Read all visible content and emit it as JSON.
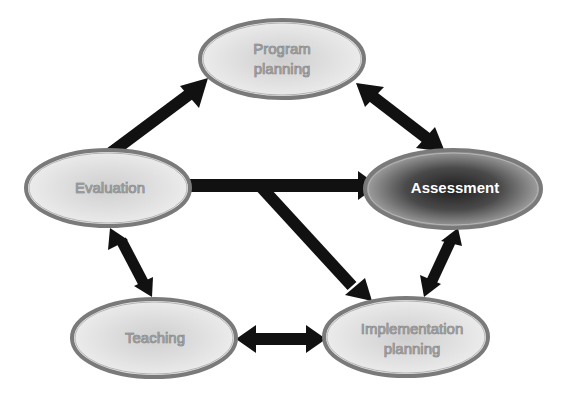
{
  "diagram": {
    "nodes": [
      {
        "id": "program-planning",
        "lines": [
          "Program",
          "planning"
        ],
        "style": "light"
      },
      {
        "id": "assessment",
        "lines": [
          "Assessment"
        ],
        "style": "dark"
      },
      {
        "id": "evaluation",
        "lines": [
          "Evaluation"
        ],
        "style": "light"
      },
      {
        "id": "teaching",
        "lines": [
          "Teaching"
        ],
        "style": "light"
      },
      {
        "id": "implementation-planning",
        "lines": [
          "Implementation",
          "planning"
        ],
        "style": "light"
      }
    ],
    "edges": [
      {
        "from": "evaluation",
        "to": "program-planning",
        "direction": "one-way"
      },
      {
        "from": "program-planning",
        "to": "assessment",
        "direction": "two-way"
      },
      {
        "from": "evaluation",
        "to": "assessment",
        "direction": "one-way"
      },
      {
        "from": "evaluation",
        "to": "implementation-planning",
        "direction": "one-way"
      },
      {
        "from": "assessment",
        "to": "implementation-planning",
        "direction": "two-way"
      },
      {
        "from": "teaching",
        "to": "implementation-planning",
        "direction": "two-way"
      },
      {
        "from": "evaluation",
        "to": "teaching",
        "direction": "two-way"
      }
    ],
    "colors": {
      "arrow": "#111111",
      "node_border": "#777777",
      "node_fill_light": "#e4e4e4",
      "node_fill_dark": "#3a3a3a",
      "background": "#ffffff"
    }
  }
}
